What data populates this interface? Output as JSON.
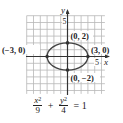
{
  "chart_data": {
    "type": "line",
    "title": "",
    "subtitle": "",
    "xlabel": "x",
    "ylabel": "y",
    "xlim": [
      -6,
      5.5
    ],
    "ylim": [
      -5.5,
      6
    ],
    "grid": true,
    "legend": null,
    "x_tick_labels": [
      {
        "value": 5,
        "label": "5"
      }
    ],
    "y_tick_labels": [
      {
        "value": 5,
        "label": "5"
      }
    ],
    "series": [
      {
        "name": "ellipse",
        "equation": "x^2/9 + y^2/4 = 1",
        "center": [
          0,
          0
        ],
        "semi_major_x": 3,
        "semi_minor_y": 2
      }
    ],
    "points": [
      {
        "x": 0,
        "y": 2,
        "label": "(0, 2)"
      },
      {
        "x": -3,
        "y": 0,
        "label": "(−3, 0)"
      },
      {
        "x": 3,
        "y": 0,
        "label": "(3, 0)"
      },
      {
        "x": 0,
        "y": -2,
        "label": "(0, −2)"
      }
    ],
    "annotations": [
      "(0, 2)",
      "(−3, 0)",
      "(3, 0)",
      "(0, −2)"
    ]
  },
  "labels": {
    "x_axis": "x",
    "y_axis": "y",
    "x_tick": "5",
    "y_tick": "5",
    "point_top": "(0, 2)",
    "point_left": "(−3, 0)",
    "point_right": "(3, 0)",
    "point_bottom": "(0, −2)"
  },
  "equation": {
    "term1_num": "x",
    "term1_exp": "2",
    "term1_den": "9",
    "plus": "+",
    "term2_num": "y",
    "term2_exp": "2",
    "term2_den": "4",
    "equals": "= 1"
  },
  "colors": {
    "grid": "#b8b8b8",
    "axis": "#333333",
    "curve": "#444444",
    "point": "#333333"
  }
}
